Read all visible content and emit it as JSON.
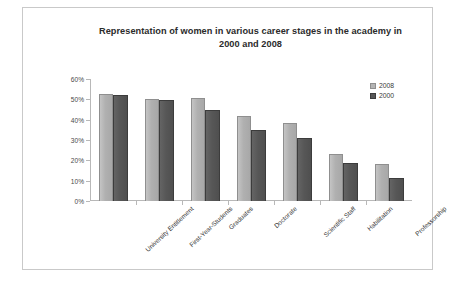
{
  "chart_data": {
    "type": "bar",
    "title": "Representation of women in various career stages in the academy in 2000 and 2008",
    "title_line1": "Representation of women in various career stages in the academy in",
    "title_line2": "2000 and 2008",
    "xlabel": "",
    "ylabel": "",
    "ylim": [
      0,
      60
    ],
    "ytick_step": 10,
    "ytick_labels": [
      "0%",
      "10%",
      "20%",
      "30%",
      "40%",
      "50%",
      "60%"
    ],
    "ytick_values": [
      0,
      10,
      20,
      30,
      40,
      50,
      60
    ],
    "grid": false,
    "legend_position": "top-right",
    "categories": [
      "University Entitlement",
      "First-Year-Students",
      "Graduates",
      "Doctorate",
      "Scientific Staff",
      "Habilitation",
      "Professorship"
    ],
    "series": [
      {
        "name": "2008",
        "color": "#b4b4b4",
        "values": [
          52.5,
          50.0,
          50.8,
          42.0,
          38.5,
          23.0,
          18.0
        ]
      },
      {
        "name": "2000",
        "color": "#575757",
        "values": [
          52.0,
          49.5,
          45.0,
          34.8,
          31.0,
          18.5,
          11.5
        ]
      }
    ]
  },
  "legend": {
    "entries": [
      {
        "label": "2008"
      },
      {
        "label": "2000"
      }
    ]
  },
  "colors": {
    "bar_2008": "#b4b4b4",
    "bar_2000": "#575757",
    "axis": "#b8b8b8",
    "text": "#3a3a3a",
    "frame": "#c9c9c9",
    "background": "#ffffff"
  }
}
